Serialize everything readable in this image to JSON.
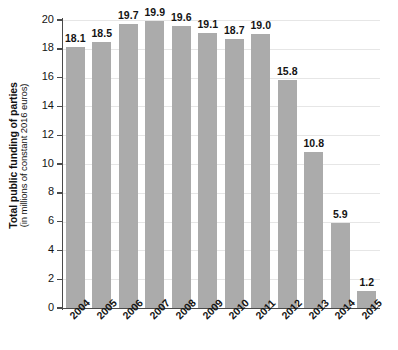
{
  "chart_data": {
    "type": "bar",
    "title": "",
    "subtitle": "",
    "xlabel": "",
    "ylabel": "Total public funding of parties",
    "ylabel_sub": "(in millions of constant 2016 euros)",
    "categories": [
      "2004",
      "2005",
      "2006",
      "2007",
      "2008",
      "2009",
      "2010",
      "2011",
      "2012",
      "2013",
      "2014",
      "2015"
    ],
    "values": [
      18.1,
      18.5,
      19.7,
      19.9,
      19.6,
      19.1,
      18.7,
      19.0,
      15.8,
      10.8,
      5.9,
      1.2
    ],
    "value_labels": [
      "18.1",
      "18.5",
      "19.7",
      "19.9",
      "19.6",
      "19.1",
      "18.7",
      "19.0",
      "15.8",
      "10.8",
      "5.9",
      "1.2"
    ],
    "ylim": [
      0,
      20
    ],
    "yticks": [
      0,
      2,
      4,
      6,
      8,
      10,
      12,
      14,
      16,
      18,
      20
    ],
    "ytick_labels": [
      "0",
      "2",
      "4",
      "6",
      "8",
      "10",
      "12",
      "14",
      "16",
      "18",
      "20"
    ],
    "grid": true,
    "grid_axis": "y",
    "legend": false,
    "legend_position": "none",
    "bar_color": "#ababab",
    "grid_color": "#e6e6e6",
    "axis_color": "#4a4a4a",
    "text_color": "#141414",
    "background_color": "#ffffff",
    "xtick_rotation": -45
  }
}
